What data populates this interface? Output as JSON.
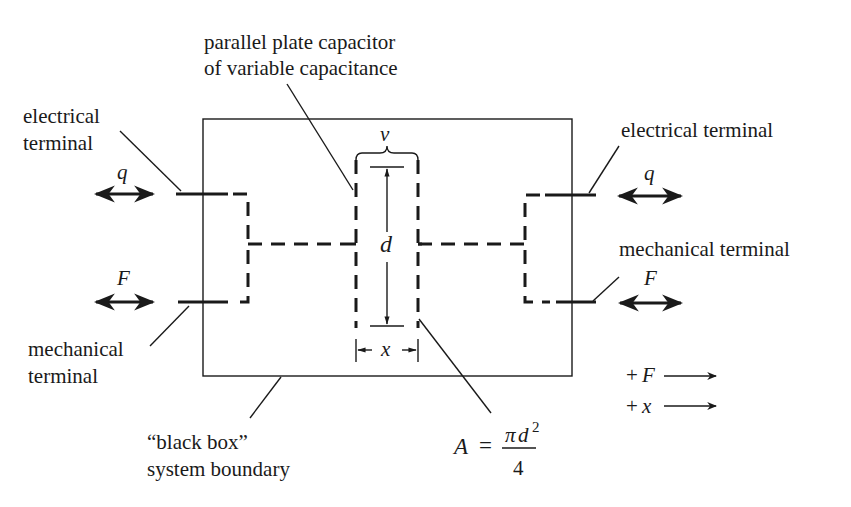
{
  "diagram": {
    "labels": {
      "capacitor_line1": "parallel plate capacitor",
      "capacitor_line2": "of variable capacitance",
      "left_electrical_line1": "electrical",
      "left_electrical_line2": "terminal",
      "left_mechanical_line1": "mechanical",
      "left_mechanical_line2": "terminal",
      "right_electrical": "electrical terminal",
      "right_mechanical": "mechanical terminal",
      "boundary_line1": "“black box”",
      "boundary_line2": "system boundary"
    },
    "symbols": {
      "q_left": "q",
      "F_left": "F",
      "q_right": "q",
      "F_right": "F",
      "v": "v",
      "d": "d",
      "x": "x"
    },
    "formula": {
      "lhs": "A",
      "eq": "=",
      "numerator_pi": "π",
      "numerator_d": "d",
      "exponent": "2",
      "denominator": "4"
    },
    "legend": {
      "plus_F_sign": "+",
      "plus_F_var": "F",
      "plus_x_sign": "+",
      "plus_x_var": "x"
    },
    "colors": {
      "ink": "#1a1a1a",
      "background": "#ffffff"
    }
  }
}
